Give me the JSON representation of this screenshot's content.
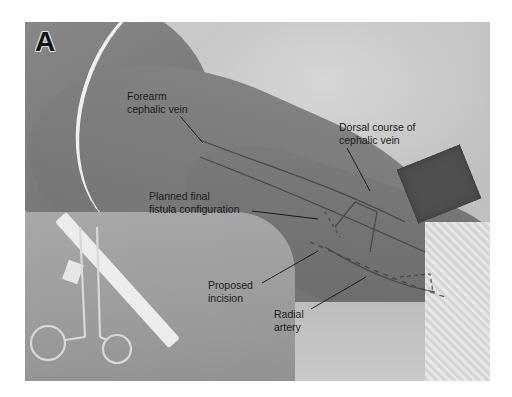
{
  "figure": {
    "panel_letter": "A",
    "labels": {
      "forearm_cephalic_vein": {
        "line1": "Forearm",
        "line2": "cephalic vein"
      },
      "dorsal_course": {
        "line1": "Dorsal course of",
        "line2": "cephalic vein"
      },
      "planned_final": {
        "line1": "Planned final",
        "line2": "fistula configuration"
      },
      "proposed_incision": {
        "line1": "Proposed",
        "line2": "incision"
      },
      "radial_artery": {
        "line1": "Radial",
        "line2": "artery"
      }
    }
  }
}
